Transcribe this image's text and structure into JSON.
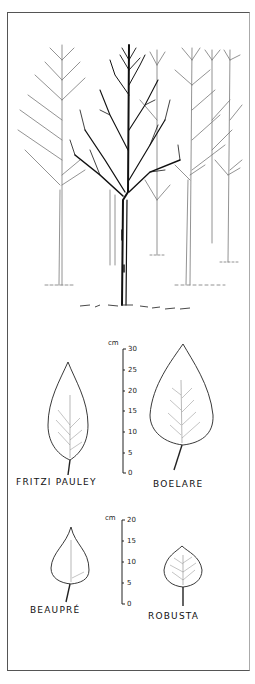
{
  "illustration": {
    "subject": "poplar tree cultivars: tree silhouette and leaf comparison",
    "colors": {
      "ink": "#111111",
      "frame": "#555555",
      "background": "#ffffff"
    }
  },
  "scale_large": {
    "unit": "cm",
    "ticks": [
      "30",
      "25",
      "20",
      "15",
      "10",
      "5",
      "0"
    ]
  },
  "scale_small": {
    "unit": "cm",
    "ticks": [
      "20",
      "15",
      "10",
      "5",
      "0"
    ]
  },
  "leaves": [
    {
      "name": "FRITZI PAULEY",
      "approx_length_cm": 21
    },
    {
      "name": "BOELARE",
      "approx_length_cm": 29
    },
    {
      "name": "BEAUPRÉ",
      "approx_length_cm": 19
    },
    {
      "name": "ROBUSTA",
      "approx_length_cm": 14
    }
  ]
}
